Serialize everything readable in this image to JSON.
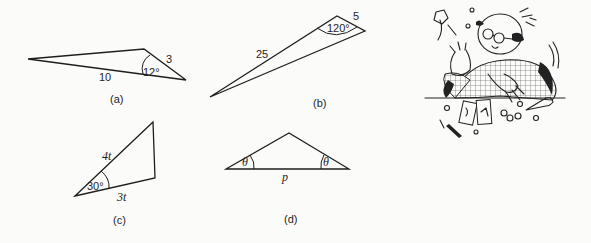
{
  "figure": {
    "panels": [
      {
        "id": "a",
        "caption": "(a)",
        "side_labels": [
          "3",
          "10"
        ],
        "angle_label": "12°"
      },
      {
        "id": "b",
        "caption": "(b)",
        "side_labels": [
          "25",
          "5"
        ],
        "angle_label": "120°"
      },
      {
        "id": "c",
        "caption": "(c)",
        "side_labels": [
          "4t",
          "3t"
        ],
        "angle_label": "30°"
      },
      {
        "id": "d",
        "caption": "(d)",
        "side_labels": [
          "p"
        ],
        "angle_labels": [
          "θ",
          "θ"
        ]
      }
    ],
    "illustration": {
      "description": "cartoon of a frazzled bald man with glasses and checked jacket surrounded by scattered calculators, pencils and papers"
    }
  }
}
